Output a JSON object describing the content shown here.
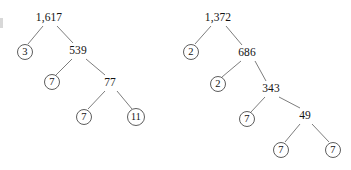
{
  "figure": {
    "background_color": "#ffffff",
    "stroke_color": "#6e6e6e",
    "text_color": "#121212",
    "width": 351,
    "height": 170
  },
  "trees": [
    {
      "id": "left-tree",
      "root_value": "1,617",
      "nodes": [
        {
          "id": "l-root",
          "label": "1,617",
          "circled": false,
          "x": 49,
          "y": 18
        },
        {
          "id": "l-n3",
          "label": "3",
          "circled": true,
          "x": 25,
          "y": 52
        },
        {
          "id": "l-n539",
          "label": "539",
          "circled": false,
          "x": 78,
          "y": 51
        },
        {
          "id": "l-n7a",
          "label": "7",
          "circled": true,
          "x": 52,
          "y": 82
        },
        {
          "id": "l-n77",
          "label": "77",
          "circled": false,
          "x": 110,
          "y": 83
        },
        {
          "id": "l-n7b",
          "label": "7",
          "circled": true,
          "x": 84,
          "y": 117
        },
        {
          "id": "l-n11",
          "label": "11",
          "circled": true,
          "x": 136,
          "y": 117
        }
      ],
      "edges": [
        {
          "from": "l-root",
          "to": "l-n3",
          "x1": 43,
          "y1": 26,
          "x2": 28,
          "y2": 44
        },
        {
          "from": "l-root",
          "to": "l-n539",
          "x1": 57,
          "y1": 26,
          "x2": 73,
          "y2": 43
        },
        {
          "from": "l-n539",
          "to": "l-n7a",
          "x1": 72,
          "y1": 59,
          "x2": 56,
          "y2": 75
        },
        {
          "from": "l-n539",
          "to": "l-n77",
          "x1": 86,
          "y1": 59,
          "x2": 105,
          "y2": 75
        },
        {
          "from": "l-n77",
          "to": "l-n7b",
          "x1": 105,
          "y1": 91,
          "x2": 88,
          "y2": 109
        },
        {
          "from": "l-n77",
          "to": "l-n11",
          "x1": 117,
          "y1": 91,
          "x2": 132,
          "y2": 109
        }
      ]
    },
    {
      "id": "right-tree",
      "root_value": "1,372",
      "nodes": [
        {
          "id": "r-root",
          "label": "1,372",
          "circled": false,
          "x": 218,
          "y": 18
        },
        {
          "id": "r-n2a",
          "label": "2",
          "circled": true,
          "x": 191,
          "y": 52
        },
        {
          "id": "r-n686",
          "label": "686",
          "circled": false,
          "x": 247,
          "y": 53
        },
        {
          "id": "r-n2b",
          "label": "2",
          "circled": true,
          "x": 218,
          "y": 84
        },
        {
          "id": "r-n343",
          "label": "343",
          "circled": false,
          "x": 271,
          "y": 89
        },
        {
          "id": "r-n7a",
          "label": "7",
          "circled": true,
          "x": 247,
          "y": 119
        },
        {
          "id": "r-n49",
          "label": "49",
          "circled": false,
          "x": 305,
          "y": 116
        },
        {
          "id": "r-n7b",
          "label": "7",
          "circled": true,
          "x": 281,
          "y": 150
        },
        {
          "id": "r-n7c",
          "label": "7",
          "circled": true,
          "x": 333,
          "y": 150
        }
      ],
      "edges": [
        {
          "from": "r-root",
          "to": "r-n2a",
          "x1": 211,
          "y1": 26,
          "x2": 195,
          "y2": 44
        },
        {
          "from": "r-root",
          "to": "r-n686",
          "x1": 226,
          "y1": 26,
          "x2": 242,
          "y2": 45
        },
        {
          "from": "r-n686",
          "to": "r-n2b",
          "x1": 241,
          "y1": 61,
          "x2": 222,
          "y2": 77
        },
        {
          "from": "r-n686",
          "to": "r-n343",
          "x1": 255,
          "y1": 61,
          "x2": 266,
          "y2": 81
        },
        {
          "from": "r-n343",
          "to": "r-n7a",
          "x1": 265,
          "y1": 97,
          "x2": 251,
          "y2": 112
        },
        {
          "from": "r-n343",
          "to": "r-n49",
          "x1": 279,
          "y1": 97,
          "x2": 300,
          "y2": 108
        },
        {
          "from": "r-n49",
          "to": "r-n7b",
          "x1": 300,
          "y1": 124,
          "x2": 285,
          "y2": 142
        },
        {
          "from": "r-n49",
          "to": "r-n7c",
          "x1": 312,
          "y1": 124,
          "x2": 329,
          "y2": 142
        }
      ]
    }
  ]
}
